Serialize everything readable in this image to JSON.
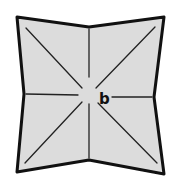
{
  "diagram": {
    "type": "folded-paper-square",
    "colors": {
      "fill": "#dcdcdc",
      "outline": "#111111",
      "crease": "#222222",
      "background": "#ffffff"
    },
    "outline_points": [
      [
        17,
        17
      ],
      [
        89,
        27
      ],
      [
        164,
        17
      ],
      [
        154,
        97
      ],
      [
        164,
        174
      ],
      [
        89,
        160
      ],
      [
        17,
        172
      ],
      [
        24,
        94
      ]
    ],
    "center": [
      89,
      95
    ],
    "creases": [
      {
        "name": "diagonal-top-left",
        "from": [
          26,
          28
        ],
        "to": [
          82,
          88
        ]
      },
      {
        "name": "diagonal-top-right",
        "from": [
          155,
          27
        ],
        "to": [
          96,
          88
        ]
      },
      {
        "name": "diagonal-bottom-left",
        "from": [
          25,
          163
        ],
        "to": [
          82,
          102
        ]
      },
      {
        "name": "diagonal-bottom-right",
        "from": [
          157,
          163
        ],
        "to": [
          98,
          103
        ]
      },
      {
        "name": "midline-top",
        "from": [
          89,
          29
        ],
        "to": [
          89,
          77
        ]
      },
      {
        "name": "midline-bottom",
        "from": [
          89,
          104
        ],
        "to": [
          89,
          158
        ]
      },
      {
        "name": "midline-left",
        "from": [
          26,
          94
        ],
        "to": [
          78,
          95
        ]
      },
      {
        "name": "midline-right",
        "from": [
          112,
          97
        ],
        "to": [
          152,
          97
        ]
      }
    ],
    "labels": [
      {
        "text": "b",
        "x": 99,
        "y": 104
      }
    ]
  }
}
